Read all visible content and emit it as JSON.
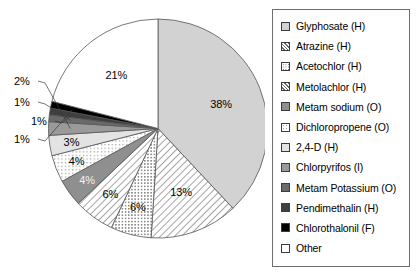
{
  "chart_data": {
    "type": "pie",
    "title": "",
    "subtitle": "",
    "xlabel": "",
    "ylabel": "",
    "units": "percent",
    "legend_position": "right",
    "grid": false,
    "categories": [
      "Glyphosate (H)",
      "Atrazine (H)",
      "Acetochlor (H)",
      "Metolachlor (H)",
      "Metam sodium (O)",
      "Dichloropropene (O)",
      "2,4-D (H)",
      "Chlorpyrifos (I)",
      "Metam Potassium (O)",
      "Pendimethalin (H)",
      "Chlorothalonil (F)",
      "Other"
    ],
    "values": [
      38,
      13,
      6,
      6,
      4,
      4,
      3,
      2,
      1,
      1,
      1,
      21
    ],
    "value_labels": [
      "38%",
      "13%",
      "6%",
      "6%",
      "4%",
      "4%",
      "3%",
      "2%",
      "1%",
      "1%",
      "1%",
      "21%"
    ],
    "slices": [
      {
        "label": "Glyphosate (H)",
        "value": 38,
        "display": "38%",
        "fill": "#d2d2d2",
        "pattern": "solid",
        "label_color": "dark",
        "callout": false
      },
      {
        "label": "Atrazine (H)",
        "value": 13,
        "display": "13%",
        "fill": "#ffffff",
        "pattern": "diagonal",
        "label_color": "dark",
        "callout": false
      },
      {
        "label": "Acetochlor (H)",
        "value": 6,
        "display": "6%",
        "fill": "#ffffff",
        "pattern": "dotted",
        "label_color": "dark",
        "callout": false
      },
      {
        "label": "Metolachlor (H)",
        "value": 6,
        "display": "6%",
        "fill": "#ffffff",
        "pattern": "diagonal",
        "label_color": "dark",
        "callout": false
      },
      {
        "label": "Metam sodium (O)",
        "value": 4,
        "display": "4%",
        "fill": "#8f8f8f",
        "pattern": "solid",
        "label_color": "light",
        "callout": false
      },
      {
        "label": "Dichloropropene (O)",
        "value": 4,
        "display": "4%",
        "fill": "#ffffff",
        "pattern": "dotted-light",
        "label_color": "dark",
        "callout": false
      },
      {
        "label": "2,4-D (H)",
        "value": 3,
        "display": "3%",
        "fill": "#e3e3e3",
        "pattern": "solid",
        "label_color": "dark",
        "callout": false
      },
      {
        "label": "Chlorpyrifos (I)",
        "value": 2,
        "display": "2%",
        "fill": "#9a9a9a",
        "pattern": "solid",
        "label_color": "dark",
        "callout": true
      },
      {
        "label": "Metam Potassium (O)",
        "value": 1,
        "display": "1%",
        "fill": "#6a6a6a",
        "pattern": "solid",
        "label_color": "dark",
        "callout": true
      },
      {
        "label": "Pendimethalin (H)",
        "value": 1,
        "display": "1%",
        "fill": "#3f3f3f",
        "pattern": "solid",
        "label_color": "dark",
        "callout": true
      },
      {
        "label": "Chlorothalonil (F)",
        "value": 1,
        "display": "1%",
        "fill": "#000000",
        "pattern": "solid",
        "label_color": "dark",
        "callout": true
      },
      {
        "label": "Other",
        "value": 21,
        "display": "21%",
        "fill": "#ffffff",
        "pattern": "solid",
        "label_color": "dark",
        "callout": false
      }
    ],
    "callouts": [
      {
        "text": "1%",
        "slice": "Chlorothalonil (F)"
      },
      {
        "text": "1%",
        "slice": "Pendimethalin (H)"
      },
      {
        "text": "1%",
        "slice": "Metam Potassium (O)"
      },
      {
        "text": "2%",
        "slice": "Chlorpyrifos (I)"
      }
    ]
  },
  "legend": {
    "items": [
      {
        "label": "Glyphosate (H)"
      },
      {
        "label": "Atrazine (H)"
      },
      {
        "label": "Acetochlor (H)"
      },
      {
        "label": "Metolachlor (H)"
      },
      {
        "label": "Metam sodium (O)"
      },
      {
        "label": "Dichloropropene (O)"
      },
      {
        "label": "2,4-D (H)"
      },
      {
        "label": "Chlorpyrifos (I)"
      },
      {
        "label": "Metam Potassium (O)"
      },
      {
        "label": "Pendimethalin (H)"
      },
      {
        "label": "Chlorothalonil (F)"
      },
      {
        "label": "Other"
      }
    ]
  },
  "colors": {
    "outline": "#555555",
    "legend_border": "#6e6e6e",
    "background": "#ffffff"
  }
}
